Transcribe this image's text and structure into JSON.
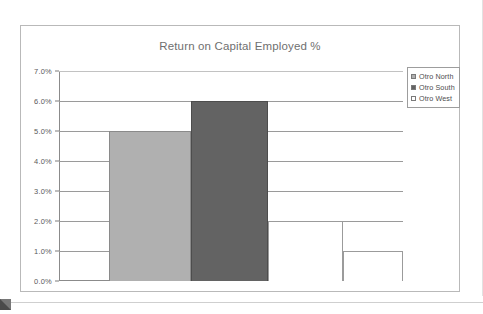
{
  "document": {
    "frame_border_color": "#b9b9b9",
    "background_color": "#ffffff"
  },
  "chart": {
    "title": "Return on Capital Employed %",
    "title_color": "#6f6f6f",
    "plot_background": "#ffffff",
    "axis_color": "#8b8b8b",
    "gridline_color": "#9a9a9a"
  },
  "legend": {
    "position": "top-right",
    "items": [
      {
        "label": "Otro North",
        "swatch": "light",
        "color": "#b0b0b0"
      },
      {
        "label": "Otro South",
        "swatch": "dark",
        "color": "#636363"
      },
      {
        "label": "Otro West",
        "swatch": "white",
        "color": "#ffffff"
      }
    ]
  },
  "yaxis": {
    "ticks": [
      "7.0%",
      "6.0%",
      "5.0%",
      "4.0%",
      "3.0%",
      "2.0%",
      "1.0%",
      "0.0%"
    ],
    "tick_values": [
      7.0,
      6.0,
      5.0,
      4.0,
      3.0,
      2.0,
      1.0,
      0.0
    ],
    "min": 0.0,
    "max": 7.0,
    "step": 1.0,
    "label_color": "#5a5a5a"
  },
  "chart_data": {
    "type": "bar",
    "title": "Return on Capital Employed %",
    "xlabel": "",
    "ylabel": "",
    "ylim": [
      0.0,
      7.0
    ],
    "ytick_step": 1.0,
    "grid": true,
    "legend_position": "top-right",
    "categories": [
      "Otro North",
      "Otro South",
      "Otro West",
      "Otro West"
    ],
    "series": [
      {
        "name": "Return on Capital Employed %",
        "values": [
          5.0,
          6.0,
          2.0,
          1.0
        ]
      }
    ],
    "bars": [
      {
        "label": "Otro North",
        "value": 5.0,
        "style": "light",
        "color": "#b0b0b0"
      },
      {
        "label": "Otro South",
        "value": 6.0,
        "style": "dark",
        "color": "#636363"
      },
      {
        "label": "Otro West",
        "value": 2.0,
        "style": "white",
        "color": "#ffffff"
      },
      {
        "label": "Otro West",
        "value": 1.0,
        "style": "white",
        "color": "#ffffff"
      }
    ],
    "value_unit": "%"
  }
}
